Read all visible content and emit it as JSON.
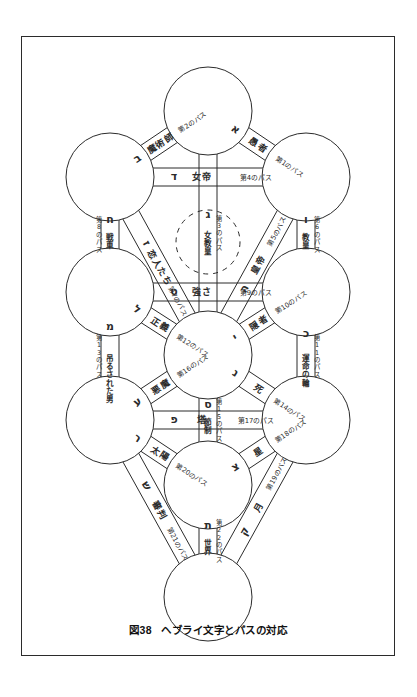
{
  "figure": {
    "caption_number": "図38",
    "caption_text": "ヘブライ文字とパスの対応",
    "ink_color": "#2b2b2b",
    "background_color": "#ffffff"
  },
  "chart_data": {
    "type": "diagram",
    "title": "ヘブライ文字とパスの対応",
    "subtype": "kabbalistic-tree-of-life",
    "path_word": "のパス",
    "nodes": [
      {
        "id": "kether",
        "cx": 186,
        "cy": 74,
        "r": 44,
        "style": "solid"
      },
      {
        "id": "chokmah",
        "cx": 88,
        "cy": 140,
        "r": 44,
        "style": "solid"
      },
      {
        "id": "binah",
        "cx": 284,
        "cy": 140,
        "r": 44,
        "style": "solid"
      },
      {
        "id": "daath",
        "cx": 186,
        "cy": 205,
        "r": 32,
        "style": "dashed"
      },
      {
        "id": "chesed",
        "cx": 88,
        "cy": 255,
        "r": 44,
        "style": "solid"
      },
      {
        "id": "geburah",
        "cx": 284,
        "cy": 255,
        "r": 44,
        "style": "solid"
      },
      {
        "id": "tiphareth",
        "cx": 186,
        "cy": 318,
        "r": 44,
        "style": "solid"
      },
      {
        "id": "netzach",
        "cx": 88,
        "cy": 383,
        "r": 44,
        "style": "solid"
      },
      {
        "id": "hod",
        "cx": 284,
        "cy": 383,
        "r": 44,
        "style": "solid"
      },
      {
        "id": "yesod",
        "cx": 186,
        "cy": 448,
        "r": 44,
        "style": "solid"
      },
      {
        "id": "malkuth",
        "cx": 186,
        "cy": 560,
        "r": 44,
        "style": "solid"
      }
    ],
    "paths": [
      {
        "n": 1,
        "letter": "א",
        "tarot": "愚者",
        "number_label": "第1のパス",
        "from": "kether",
        "to": "binah"
      },
      {
        "n": 2,
        "letter": "ב",
        "tarot": "魔術師",
        "number_label": "第2のパス",
        "from": "kether",
        "to": "chokmah"
      },
      {
        "n": 3,
        "letter": "ג",
        "tarot": "女教皇",
        "number_label": "第3のパス",
        "from": "kether",
        "to": "tiphareth"
      },
      {
        "n": 4,
        "letter": "ד",
        "tarot": "女帝",
        "number_label": "第4のパス",
        "from": "chokmah",
        "to": "binah"
      },
      {
        "n": 5,
        "letter": "ה",
        "tarot": "皇帝",
        "number_label": "第5のパス",
        "from": "binah",
        "to": "tiphareth"
      },
      {
        "n": 6,
        "letter": "ו",
        "tarot": "教皇",
        "number_label": "第6のパス",
        "from": "binah",
        "to": "geburah"
      },
      {
        "n": 7,
        "letter": "ז",
        "tarot": "恋人たち",
        "number_label": "第7のパス",
        "from": "chokmah",
        "to": "tiphareth"
      },
      {
        "n": 8,
        "letter": "ח",
        "tarot": "戦車",
        "number_label": "第8のパス",
        "from": "chokmah",
        "to": "chesed"
      },
      {
        "n": 9,
        "letter": "ט",
        "tarot": "強さ",
        "number_label": "第9のパス",
        "from": "chesed",
        "to": "geburah"
      },
      {
        "n": 10,
        "letter": "י",
        "tarot": "隠者",
        "number_label": "第10のパス",
        "from": "geburah",
        "to": "tiphareth"
      },
      {
        "n": 11,
        "letter": "כ",
        "tarot": "運命の輪",
        "number_label": "第11のパス",
        "from": "geburah",
        "to": "hod"
      },
      {
        "n": 12,
        "letter": "ל",
        "tarot": "正義",
        "number_label": "第12のパス",
        "from": "chesed",
        "to": "tiphareth"
      },
      {
        "n": 13,
        "letter": "מ",
        "tarot": "吊るされた男",
        "number_label": "第13のパス",
        "from": "chesed",
        "to": "netzach"
      },
      {
        "n": 14,
        "letter": "נ",
        "tarot": "死",
        "number_label": "第14のパス",
        "from": "tiphareth",
        "to": "hod"
      },
      {
        "n": 15,
        "letter": "ס",
        "tarot": "節制",
        "number_label": "第15のパス",
        "from": "tiphareth",
        "to": "yesod"
      },
      {
        "n": 16,
        "letter": "ע",
        "tarot": "悪魔",
        "number_label": "第16のパス",
        "from": "tiphareth",
        "to": "netzach"
      },
      {
        "n": 17,
        "letter": "פ",
        "tarot": "塔",
        "number_label": "第17のパス",
        "from": "netzach",
        "to": "hod"
      },
      {
        "n": 18,
        "letter": "צ",
        "tarot": "星",
        "number_label": "第18のパス",
        "from": "hod",
        "to": "yesod"
      },
      {
        "n": 19,
        "letter": "ק",
        "tarot": "月",
        "number_label": "第19のパス",
        "from": "hod",
        "to": "malkuth"
      },
      {
        "n": 20,
        "letter": "ר",
        "tarot": "太陽",
        "number_label": "第20のパス",
        "from": "netzach",
        "to": "yesod"
      },
      {
        "n": 21,
        "letter": "ש",
        "tarot": "審判",
        "number_label": "第21のパス",
        "from": "netzach",
        "to": "malkuth"
      },
      {
        "n": 22,
        "letter": "ת",
        "tarot": "世界",
        "number_label": "第22のパス",
        "from": "yesod",
        "to": "malkuth"
      }
    ]
  }
}
